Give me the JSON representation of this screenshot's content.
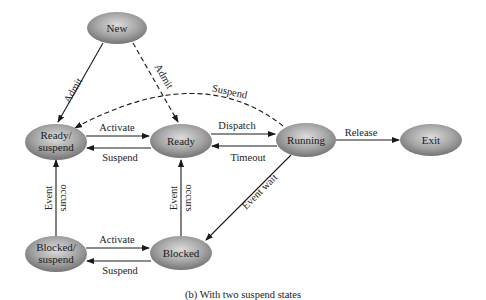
{
  "diagram": {
    "caption": "(b) With two suspend states",
    "nodes": {
      "new": {
        "label": "New"
      },
      "ready_suspend": {
        "line1": "Ready/",
        "line2": "suspend"
      },
      "ready": {
        "label": "Ready"
      },
      "running": {
        "label": "Running"
      },
      "exit": {
        "label": "Exit"
      },
      "blocked_suspend": {
        "line1": "Blocked/",
        "line2": "suspend"
      },
      "blocked": {
        "label": "Blocked"
      }
    },
    "edges": {
      "new_to_ready_suspend": "Admit",
      "new_to_ready": "Admit",
      "running_to_ready_suspend": "Suspend",
      "ready_suspend_to_ready": "Activate",
      "ready_to_ready_suspend": "Suspend",
      "ready_to_running": "Dispatch",
      "running_to_ready": "Timeout",
      "running_to_exit": "Release",
      "running_to_blocked": "Event wait",
      "blocked_suspend_to_ready_suspend": {
        "line1": "Event",
        "line2": "occurs"
      },
      "blocked_to_ready": {
        "line1": "Event",
        "line2": "occurs"
      },
      "blocked_suspend_to_blocked": "Activate",
      "blocked_to_blocked_suspend": "Suspend"
    },
    "colors": {
      "node_fill_light": "#d9d9d9",
      "node_fill_dark": "#7a7a7a",
      "line": "#1a1a1a"
    }
  }
}
